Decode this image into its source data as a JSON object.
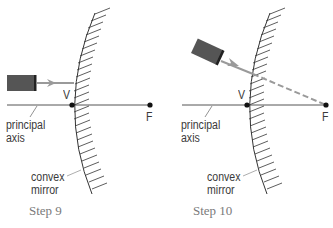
{
  "panels": [
    {
      "id": "step9",
      "caption": "Step 9",
      "labels": {
        "vertex": "V",
        "focus": "F",
        "axis_line1": "principal",
        "axis_line2": "axis",
        "mirror_line1": "convex",
        "mirror_line2": "mirror"
      }
    },
    {
      "id": "step10",
      "caption": "Step 10",
      "labels": {
        "vertex": "V",
        "focus": "F",
        "axis_line1": "principal",
        "axis_line2": "axis",
        "mirror_line1": "convex",
        "mirror_line2": "mirror"
      }
    }
  ],
  "colors": {
    "line": "#333333",
    "ray": "#9a9a9a",
    "flashlight": "#555555",
    "caption": "#7a7a7a"
  }
}
